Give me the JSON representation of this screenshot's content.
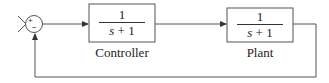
{
  "diagram": {
    "type": "feedback-control-loop",
    "summing_junction": {
      "plus_sign": "+",
      "minus_sign": "−"
    },
    "blocks": [
      {
        "name": "Controller",
        "numerator": "1",
        "denominator_var": "s",
        "denominator_rest": " + 1",
        "label": "Controller"
      },
      {
        "name": "Plant",
        "numerator": "1",
        "denominator_var": "s",
        "denominator_rest": " + 1",
        "label": "Plant"
      }
    ],
    "colors": {
      "line": "#555555",
      "text": "#222222",
      "background": "#ffffff"
    }
  }
}
